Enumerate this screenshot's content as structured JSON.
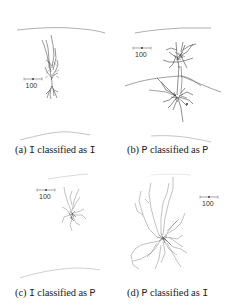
{
  "figure": {
    "panels": [
      {
        "id": "a",
        "label": "(a)",
        "true_class": "I",
        "mid_text": "classified as",
        "predicted_class": "I",
        "scale_bar": "100"
      },
      {
        "id": "b",
        "label": "(b)",
        "true_class": "P",
        "mid_text": "classified as",
        "predicted_class": "P",
        "scale_bar": "100"
      },
      {
        "id": "c",
        "label": "(c)",
        "true_class": "I",
        "mid_text": "classified as",
        "predicted_class": "P",
        "scale_bar": "100"
      },
      {
        "id": "d",
        "label": "(d)",
        "true_class": "P",
        "mid_text": "classified as",
        "predicted_class": "I",
        "scale_bar": "100"
      }
    ]
  }
}
